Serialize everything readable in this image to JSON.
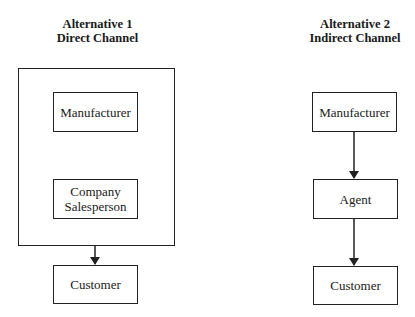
{
  "alternatives": [
    {
      "title_line1": "Alternative 1",
      "title_line2": "Direct Channel",
      "nodes": [
        {
          "label": "Manufacturer"
        },
        {
          "label_line1": "Company",
          "label_line2": "Salesperson"
        },
        {
          "label": "Customer"
        }
      ]
    },
    {
      "title_line1": "Alternative 2",
      "title_line2": "Indirect Channel",
      "nodes": [
        {
          "label": "Manufacturer"
        },
        {
          "label": "Agent"
        },
        {
          "label": "Customer"
        }
      ]
    }
  ],
  "colors": {
    "line": "#222222",
    "background": "#ffffff"
  }
}
